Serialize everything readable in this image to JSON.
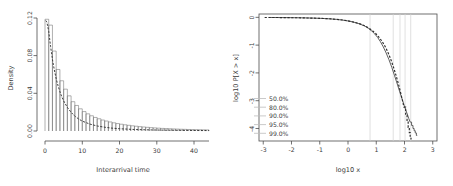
{
  "figure": {
    "background": "#ffffff",
    "panel_count": 2
  },
  "chart_data": [
    {
      "type": "bar",
      "panel": "left",
      "title": "",
      "xlabel": "Interarrival time",
      "ylabel": "Density",
      "xlim": [
        0,
        44
      ],
      "ylim": [
        0,
        0.135
      ],
      "xticks": [
        0,
        10,
        20,
        30,
        40
      ],
      "xticklabels": [
        "0",
        "10",
        "20",
        "30",
        "40"
      ],
      "yticks": [
        0.0,
        0.04,
        0.08,
        0.12
      ],
      "yticklabels": [
        "0.00",
        "0.04",
        "0.08",
        "0.12"
      ],
      "grid": false,
      "legend": "none",
      "bin_width": 1,
      "bin_edges": [
        0,
        1,
        2,
        3,
        4,
        5,
        6,
        7,
        8,
        9,
        10,
        11,
        12,
        13,
        14,
        15,
        16,
        17,
        18,
        19,
        20,
        21,
        22,
        23,
        24,
        25,
        26,
        27,
        28,
        29,
        30,
        31,
        32,
        33,
        34,
        35,
        36,
        37,
        38,
        39,
        40,
        41,
        42,
        43,
        44
      ],
      "values": [
        0.1335,
        0.1265,
        0.0955,
        0.0735,
        0.06,
        0.05,
        0.042,
        0.035,
        0.0305,
        0.0265,
        0.0232,
        0.0205,
        0.0182,
        0.0162,
        0.0146,
        0.0131,
        0.0119,
        0.0108,
        0.0098,
        0.0089,
        0.0081,
        0.0074,
        0.0068,
        0.0062,
        0.0057,
        0.0052,
        0.0048,
        0.0044,
        0.004,
        0.0037,
        0.0034,
        0.0031,
        0.0029,
        0.0027,
        0.0025,
        0.0023,
        0.0021,
        0.002,
        0.0018,
        0.0017,
        0.0016,
        0.0015,
        0.0014,
        0.0013
      ],
      "series": [
        {
          "name": "fitted density",
          "style": "dashed",
          "color": "#2b2b2b",
          "x": [
            0.2,
            0.5,
            1,
            1.5,
            2,
            2.5,
            3,
            3.5,
            4,
            4.5,
            5,
            6,
            7,
            8,
            9,
            10,
            12,
            14,
            16,
            18,
            20,
            24,
            28,
            32,
            36,
            40,
            44
          ],
          "y": [
            0.132,
            0.13,
            0.119,
            0.101,
            0.0855,
            0.073,
            0.0625,
            0.054,
            0.047,
            0.041,
            0.036,
            0.0282,
            0.0223,
            0.0178,
            0.0144,
            0.0118,
            0.0083,
            0.006,
            0.0045,
            0.0034,
            0.0027,
            0.0018,
            0.0013,
            0.001,
            0.0008,
            0.0006,
            0.0005
          ]
        }
      ]
    },
    {
      "type": "line",
      "panel": "right",
      "title": "",
      "xlabel": "log10 x",
      "ylabel": "log10 P[X > x]",
      "xlim": [
        -3.15,
        3.15
      ],
      "ylim": [
        -4.45,
        0.12
      ],
      "xticks": [
        -3,
        -2,
        -1,
        0,
        1,
        2,
        3
      ],
      "xticklabels": [
        "-3",
        "-2",
        "-1",
        "0",
        "1",
        "2",
        "3"
      ],
      "yticks": [
        0,
        -1,
        -2,
        -3,
        -4
      ],
      "yticklabels": [
        "0",
        "-1",
        "-2",
        "-3",
        "-4"
      ],
      "grid": "vertical-quantiles",
      "legend_position": "lower-left",
      "quantile_gridlines": [
        {
          "label": "50.0%",
          "log10x": 0.78,
          "color": "#d2d2d2"
        },
        {
          "label": "80.0%",
          "log10x": 1.6,
          "color": "#d2d2d2"
        },
        {
          "label": "90.0%",
          "log10x": 1.84,
          "color": "#d2d2d2"
        },
        {
          "label": "95.0%",
          "log10x": 2.02,
          "color": "#d2d2d2"
        },
        {
          "label": "99.0%",
          "log10x": 2.22,
          "color": "#d2d2d2"
        }
      ],
      "series": [
        {
          "name": "empirical",
          "style": "solid",
          "color": "#555555",
          "x": [
            -2.8,
            -2.4,
            -2.0,
            -1.6,
            -1.2,
            -0.9,
            -0.6,
            -0.4,
            -0.2,
            0.0,
            0.15,
            0.3,
            0.45,
            0.6,
            0.72,
            0.85,
            0.95,
            1.05,
            1.15,
            1.25,
            1.35,
            1.45,
            1.55,
            1.65,
            1.72,
            1.8,
            1.87,
            1.93,
            1.99,
            2.05,
            2.1,
            2.15,
            2.2,
            2.25,
            2.3,
            2.34,
            2.38,
            2.42,
            2.45
          ],
          "y": [
            -0.005,
            -0.008,
            -0.012,
            -0.018,
            -0.028,
            -0.04,
            -0.058,
            -0.075,
            -0.098,
            -0.13,
            -0.16,
            -0.2,
            -0.252,
            -0.32,
            -0.395,
            -0.5,
            -0.6,
            -0.725,
            -0.88,
            -1.065,
            -1.28,
            -1.525,
            -1.8,
            -2.105,
            -2.325,
            -2.58,
            -2.8,
            -2.985,
            -3.17,
            -3.35,
            -3.49,
            -3.64,
            -3.77,
            -3.89,
            -4.0,
            -4.08,
            -4.16,
            -4.25,
            -4.25
          ]
        },
        {
          "name": "fitted",
          "style": "dashed",
          "color": "#2b2b2b",
          "x": [
            -2.95,
            -2.6,
            -2.2,
            -1.8,
            -1.4,
            -1.0,
            -0.7,
            -0.45,
            -0.2,
            0.0,
            0.2,
            0.4,
            0.55,
            0.7,
            0.85,
            0.98,
            1.1,
            1.2,
            1.3,
            1.4,
            1.5,
            1.6,
            1.7,
            1.78,
            1.85,
            1.92,
            1.98,
            2.04,
            2.09,
            2.13,
            2.17,
            2.2,
            2.23
          ],
          "y": [
            -0.004,
            -0.006,
            -0.01,
            -0.015,
            -0.024,
            -0.036,
            -0.05,
            -0.068,
            -0.095,
            -0.128,
            -0.172,
            -0.228,
            -0.285,
            -0.362,
            -0.47,
            -0.58,
            -0.72,
            -0.855,
            -1.02,
            -1.225,
            -1.47,
            -1.76,
            -2.09,
            -2.38,
            -2.66,
            -2.96,
            -3.23,
            -3.52,
            -3.77,
            -3.96,
            -4.15,
            -4.28,
            -4.4
          ]
        }
      ]
    }
  ],
  "left_panel": {
    "ylabel": "Density",
    "xlabel": "Interarrival time",
    "yticklabels": [
      "0.00",
      "0.04",
      "0.08",
      "0.12"
    ],
    "xticklabels": [
      "0",
      "10",
      "20",
      "30",
      "40"
    ]
  },
  "right_panel": {
    "ylabel": "log10 P[X > x]",
    "xlabel": "log10 x",
    "yticklabels": [
      "0",
      "-1",
      "-2",
      "-3",
      "-4"
    ],
    "xticklabels": [
      "-3",
      "-2",
      "-1",
      "0",
      "1",
      "2",
      "3"
    ],
    "legend": [
      "50.0%",
      "80.0%",
      "90.0%",
      "95.0%",
      "99.0%"
    ]
  }
}
